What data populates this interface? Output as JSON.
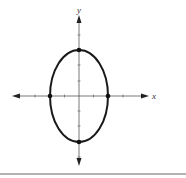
{
  "figure": {
    "title": "",
    "axes": {
      "x_label": "x",
      "y_label": "y",
      "origin": [
        79,
        96
      ],
      "x_range_px": [
        12,
        150
      ],
      "y_range_px": [
        15,
        166
      ],
      "tick_spacing_px": 14.5
    },
    "curve": {
      "type": "ellipse",
      "center": [
        0,
        0
      ],
      "semi_axis_x": 2,
      "semi_axis_y": 3,
      "vertices": [
        [
          0,
          3
        ],
        [
          0,
          -3
        ]
      ],
      "co_vertices": [
        [
          -2,
          0
        ],
        [
          2,
          0
        ]
      ]
    },
    "colors": {
      "curve": "#1a1a1a",
      "axes": "#444444",
      "rule": "#555555",
      "background": "#ffffff"
    }
  }
}
